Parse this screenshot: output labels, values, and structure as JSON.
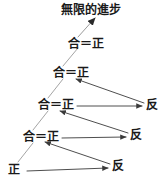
{
  "diagram": {
    "title": "無限的進步",
    "title_pos": {
      "x": 61,
      "y": 4
    },
    "colors": {
      "text": "#1a1a1a",
      "arrow": "#3a3a3a",
      "spiral_line": "#9a9a9a",
      "background": "#ffffff"
    },
    "synthesis_nodes": [
      {
        "id": "node-level-1",
        "label": "正",
        "x": 8,
        "y": 164,
        "level": 1
      },
      {
        "id": "node-level-2",
        "label": "合＝正",
        "x": 23,
        "y": 131,
        "level": 2
      },
      {
        "id": "node-level-3",
        "label": "合＝正",
        "x": 38,
        "y": 99,
        "level": 3
      },
      {
        "id": "node-level-4",
        "label": "合＝正",
        "x": 53,
        "y": 67,
        "level": 4
      },
      {
        "id": "node-level-5",
        "label": "合＝正",
        "x": 68,
        "y": 38,
        "level": 5
      }
    ],
    "antithesis_nodes": [
      {
        "id": "node-antithesis-1",
        "label": "反",
        "x": 112,
        "y": 160,
        "level": 1
      },
      {
        "id": "node-antithesis-2",
        "label": "反",
        "x": 130,
        "y": 129,
        "level": 2
      },
      {
        "id": "node-antithesis-3",
        "label": "反",
        "x": 146,
        "y": 99,
        "level": 3
      }
    ],
    "forward_arrows": [
      {
        "id": "arrow-thesis-to-antithesis-1",
        "from": {
          "x": 27,
          "y": 171
        },
        "to": {
          "x": 108,
          "y": 168
        }
      },
      {
        "id": "arrow-thesis-to-antithesis-2",
        "from": {
          "x": 62,
          "y": 138
        },
        "to": {
          "x": 126,
          "y": 137
        }
      },
      {
        "id": "arrow-thesis-to-antithesis-3",
        "from": {
          "x": 77,
          "y": 106
        },
        "to": {
          "x": 142,
          "y": 106
        }
      }
    ],
    "return_arrows": [
      {
        "id": "arrow-antithesis-to-synthesis-1",
        "from": {
          "x": 110,
          "y": 164
        },
        "to": {
          "x": 45,
          "y": 142
        }
      },
      {
        "id": "arrow-antithesis-to-synthesis-2",
        "from": {
          "x": 128,
          "y": 133
        },
        "to": {
          "x": 60,
          "y": 111
        }
      },
      {
        "id": "arrow-antithesis-to-synthesis-3",
        "from": {
          "x": 144,
          "y": 103
        },
        "to": {
          "x": 76,
          "y": 79
        }
      }
    ],
    "spiral_segments": [
      {
        "id": "spiral-segment-1",
        "from": {
          "x": 18,
          "y": 162
        },
        "to": {
          "x": 33,
          "y": 143
        }
      },
      {
        "id": "spiral-segment-2",
        "from": {
          "x": 33,
          "y": 130
        },
        "to": {
          "x": 48,
          "y": 111
        }
      },
      {
        "id": "spiral-segment-3",
        "from": {
          "x": 48,
          "y": 98
        },
        "to": {
          "x": 63,
          "y": 79
        }
      },
      {
        "id": "spiral-segment-4",
        "from": {
          "x": 63,
          "y": 66
        },
        "to": {
          "x": 78,
          "y": 48
        }
      }
    ],
    "progress_arrow": {
      "id": "arrow-infinite-progress",
      "from": {
        "x": 78,
        "y": 37
      },
      "to": {
        "x": 95,
        "y": 18
      }
    }
  }
}
